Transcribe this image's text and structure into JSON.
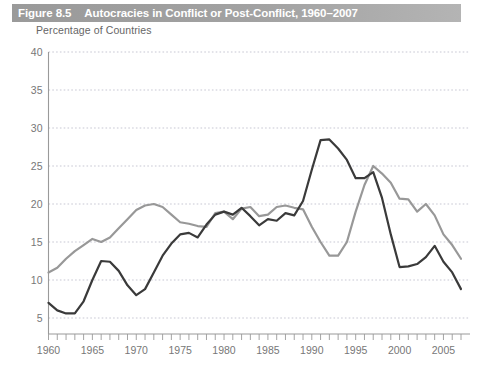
{
  "figure": {
    "number": "Figure 8.5",
    "title": "Autocracies in Conflict or Post-Conflict, 1960–2007",
    "subtitle": "Percentage of Countries"
  },
  "colors": {
    "title_bar_left": "#9a9a9a",
    "title_bar_right": "#b4b4b4",
    "title_text": "#ffffff",
    "subtitle_text": "#666666",
    "axis": "#9a9a9a",
    "gridline": "#b9b9c8",
    "tick_label": "#777777",
    "series_dark": "#3a3a3a",
    "series_gray": "#989898",
    "plot_background": "#ffffff"
  },
  "chart_data": {
    "type": "line",
    "title": "Autocracies in Conflict or Post-Conflict, 1960–2007",
    "subtitle": "Percentage of Countries",
    "xlabel": "",
    "ylabel": "Percentage of Countries",
    "xlim": [
      1960,
      2007
    ],
    "ylim": [
      0,
      41
    ],
    "yticks": [
      5,
      10,
      15,
      20,
      25,
      30,
      35,
      40
    ],
    "xticks": [
      1960,
      1961,
      1962,
      1963,
      1964,
      1965,
      1966,
      1967,
      1968,
      1969,
      1970,
      1971,
      1972,
      1973,
      1974,
      1975,
      1976,
      1977,
      1978,
      1979,
      1980,
      1981,
      1982,
      1983,
      1984,
      1985,
      1986,
      1987,
      1988,
      1989,
      1990,
      1991,
      1992,
      1993,
      1994,
      1995,
      1996,
      1997,
      1998,
      1999,
      2000,
      2001,
      2002,
      2003,
      2004,
      2005,
      2006,
      2007
    ],
    "xtick_labels": [
      1960,
      1965,
      1970,
      1975,
      1980,
      1985,
      1990,
      1995,
      2000,
      2005
    ],
    "grid": true,
    "legend_position": "none",
    "x": [
      1960,
      1961,
      1962,
      1963,
      1964,
      1965,
      1966,
      1967,
      1968,
      1969,
      1970,
      1971,
      1972,
      1973,
      1974,
      1975,
      1976,
      1977,
      1978,
      1979,
      1980,
      1981,
      1982,
      1983,
      1984,
      1985,
      1986,
      1987,
      1988,
      1989,
      1990,
      1991,
      1992,
      1993,
      1994,
      1995,
      1996,
      1997,
      1998,
      1999,
      2000,
      2001,
      2002,
      2003,
      2004,
      2005,
      2006,
      2007
    ],
    "series": [
      {
        "name": "Conflict",
        "color": "#3a3a3a",
        "values": [
          7.0,
          6.0,
          5.6,
          5.6,
          7.2,
          10.0,
          12.5,
          12.4,
          11.2,
          9.3,
          8.0,
          8.8,
          11.0,
          13.2,
          14.8,
          16.0,
          16.2,
          15.6,
          17.3,
          18.6,
          19.0,
          18.6,
          19.5,
          18.4,
          17.2,
          18.0,
          17.8,
          18.8,
          18.5,
          20.4,
          24.5,
          28.4,
          28.5,
          27.3,
          25.8,
          23.4,
          23.4,
          24.2,
          20.8,
          16.0,
          11.7,
          11.8,
          12.1,
          13.0,
          14.5,
          12.4,
          11.0,
          8.8
        ]
      },
      {
        "name": "Post-Conflict",
        "color": "#989898",
        "values": [
          11.0,
          11.6,
          12.8,
          13.8,
          14.6,
          15.4,
          15.0,
          15.6,
          16.8,
          18.0,
          19.2,
          19.8,
          20.0,
          19.6,
          18.6,
          17.6,
          17.4,
          17.1,
          17.0,
          18.8,
          19.0,
          18.0,
          19.4,
          19.6,
          18.4,
          18.6,
          19.6,
          19.8,
          19.5,
          19.3,
          17.0,
          15.0,
          13.2,
          13.2,
          15.0,
          19.0,
          22.5,
          25.0,
          24.0,
          22.8,
          20.7,
          20.6,
          19.0,
          20.0,
          18.5,
          16.0,
          14.6,
          12.8
        ]
      }
    ]
  }
}
